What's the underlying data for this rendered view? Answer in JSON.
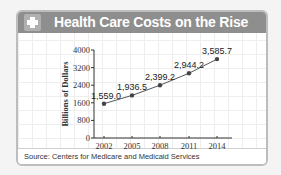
{
  "header": {
    "title": "Health Care Costs on the Rise",
    "icon": "plus-cross-icon"
  },
  "source": "Source: Centers for Medicare and Medicaid Services",
  "chart_data": {
    "type": "line",
    "title": "Health Care Costs on the Rise",
    "xlabel": "",
    "ylabel": "Billions of Dollars",
    "categories": [
      "2002",
      "2005",
      "2008",
      "2011",
      "2014"
    ],
    "values": [
      1559.0,
      1936.5,
      2399.2,
      2944.2,
      3585.7
    ],
    "data_labels": [
      "1,559.0",
      "1,936.5",
      "2,399.2",
      "2,944.2",
      "3,585.7"
    ],
    "yticks": [
      0,
      800,
      1600,
      2400,
      3200,
      4000
    ],
    "ylim": [
      0,
      4000
    ],
    "grid": false,
    "legend": "none"
  }
}
